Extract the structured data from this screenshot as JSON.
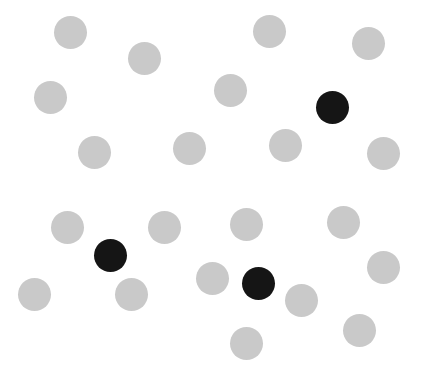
{
  "scene": {
    "width": 422,
    "height": 375,
    "background": "#ffffff",
    "dot_diameter": 33,
    "colors": {
      "gray": "#c9c9c9",
      "black": "#151515"
    },
    "counts": {
      "gray": 21,
      "black": 3,
      "total": 24
    },
    "dots": [
      {
        "x": 70,
        "y": 32,
        "color": "gray"
      },
      {
        "x": 144,
        "y": 58,
        "color": "gray"
      },
      {
        "x": 269,
        "y": 31,
        "color": "gray"
      },
      {
        "x": 368,
        "y": 43,
        "color": "gray"
      },
      {
        "x": 50,
        "y": 97,
        "color": "gray"
      },
      {
        "x": 230,
        "y": 90,
        "color": "gray"
      },
      {
        "x": 332,
        "y": 107,
        "color": "black"
      },
      {
        "x": 94,
        "y": 152,
        "color": "gray"
      },
      {
        "x": 189,
        "y": 148,
        "color": "gray"
      },
      {
        "x": 285,
        "y": 145,
        "color": "gray"
      },
      {
        "x": 383,
        "y": 153,
        "color": "gray"
      },
      {
        "x": 67,
        "y": 227,
        "color": "gray"
      },
      {
        "x": 164,
        "y": 227,
        "color": "gray"
      },
      {
        "x": 246,
        "y": 224,
        "color": "gray"
      },
      {
        "x": 343,
        "y": 222,
        "color": "gray"
      },
      {
        "x": 110,
        "y": 255,
        "color": "black"
      },
      {
        "x": 383,
        "y": 267,
        "color": "gray"
      },
      {
        "x": 34,
        "y": 294,
        "color": "gray"
      },
      {
        "x": 131,
        "y": 294,
        "color": "gray"
      },
      {
        "x": 212,
        "y": 278,
        "color": "gray"
      },
      {
        "x": 258,
        "y": 283,
        "color": "black"
      },
      {
        "x": 301,
        "y": 300,
        "color": "gray"
      },
      {
        "x": 359,
        "y": 330,
        "color": "gray"
      },
      {
        "x": 246,
        "y": 343,
        "color": "gray"
      }
    ]
  }
}
